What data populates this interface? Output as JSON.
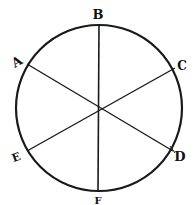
{
  "diagram": {
    "title": "",
    "type": "circle divided into six sectors by three diameters",
    "colors": {
      "stroke": "#1a1a1a",
      "background": "#ffffff"
    },
    "circle": {
      "cx": 99,
      "cy": 108,
      "r": 83
    },
    "center": {
      "x": 99,
      "y": 108
    },
    "points": [
      {
        "id": "B",
        "label": "B",
        "x": 99,
        "y": 24,
        "lx": 98,
        "ly": 19
      },
      {
        "id": "A",
        "label": "A",
        "x": 27,
        "y": 64,
        "lx": 17,
        "ly": 66
      },
      {
        "id": "C",
        "label": "C",
        "x": 175,
        "y": 68,
        "lx": 182,
        "ly": 70
      },
      {
        "id": "D",
        "label": "D",
        "x": 173,
        "y": 151,
        "lx": 179,
        "ly": 160
      },
      {
        "id": "E",
        "label": "E",
        "x": 27,
        "y": 151,
        "lx": 16,
        "ly": 160
      },
      {
        "id": "F",
        "label": "F",
        "x": 98,
        "y": 192,
        "lx": 98,
        "ly": 205
      }
    ],
    "diameters": [
      {
        "from": "B",
        "to": "F"
      },
      {
        "from": "A",
        "to": "D"
      },
      {
        "from": "C",
        "to": "E"
      }
    ]
  }
}
